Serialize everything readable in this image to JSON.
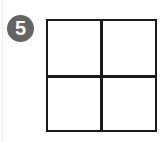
{
  "badge": {
    "number": "5",
    "background_color": "#646464",
    "text_color": "#ffffff"
  },
  "grid": {
    "rows": 2,
    "columns": 2,
    "cells": [
      {
        "row": 0,
        "col": 0,
        "content": ""
      },
      {
        "row": 0,
        "col": 1,
        "content": ""
      },
      {
        "row": 1,
        "col": 0,
        "content": ""
      },
      {
        "row": 1,
        "col": 1,
        "content": ""
      }
    ],
    "line_color": "#1a1a1a"
  }
}
